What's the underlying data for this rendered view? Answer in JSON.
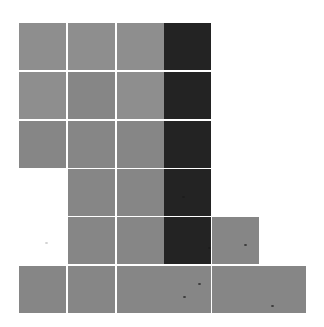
{
  "figure": {
    "colors": {
      "light": "#8e8e8e",
      "mid": "#868686",
      "dark": "#232323",
      "background": "#ffffff",
      "gap": "#ffffff"
    },
    "column_x": [
      19,
      68,
      117,
      164,
      212,
      259
    ],
    "row_y": [
      23,
      72,
      121,
      169,
      217,
      266
    ],
    "tiles": [
      {
        "row": 0,
        "col": 0,
        "shade": "light"
      },
      {
        "row": 0,
        "col": 1,
        "shade": "light"
      },
      {
        "row": 0,
        "col": 2,
        "shade": "light"
      },
      {
        "row": 0,
        "col": 3,
        "shade": "dark"
      },
      {
        "row": 1,
        "col": 0,
        "shade": "light"
      },
      {
        "row": 1,
        "col": 1,
        "shade": "mid"
      },
      {
        "row": 1,
        "col": 2,
        "shade": "light"
      },
      {
        "row": 1,
        "col": 3,
        "shade": "dark"
      },
      {
        "row": 2,
        "col": 0,
        "shade": "mid"
      },
      {
        "row": 2,
        "col": 1,
        "shade": "mid"
      },
      {
        "row": 2,
        "col": 2,
        "shade": "mid"
      },
      {
        "row": 2,
        "col": 3,
        "shade": "dark"
      },
      {
        "row": 3,
        "col": 1,
        "shade": "mid"
      },
      {
        "row": 3,
        "col": 2,
        "shade": "mid"
      },
      {
        "row": 3,
        "col": 3,
        "shade": "dark"
      },
      {
        "row": 4,
        "col": 1,
        "shade": "mid"
      },
      {
        "row": 4,
        "col": 2,
        "shade": "mid"
      },
      {
        "row": 4,
        "col": 3,
        "shade": "dark"
      },
      {
        "row": 4,
        "col": 4,
        "shade": "mid"
      },
      {
        "row": 5,
        "col": 0,
        "shade": "mid"
      },
      {
        "row": 5,
        "col": 1,
        "shade": "mid"
      },
      {
        "row": 5,
        "col": 2,
        "shade": "mid"
      },
      {
        "row": 5,
        "col": 3,
        "shade": "mid"
      },
      {
        "row": 5,
        "col": 4,
        "shade": "mid"
      },
      {
        "row": 5,
        "col": 5,
        "shade": "mid"
      }
    ],
    "specks": [
      {
        "x": 182,
        "y": 196,
        "tone": "dark"
      },
      {
        "x": 208,
        "y": 247,
        "tone": "dark"
      },
      {
        "x": 244,
        "y": 244,
        "tone": "dark"
      },
      {
        "x": 198,
        "y": 283,
        "tone": "dark"
      },
      {
        "x": 183,
        "y": 296,
        "tone": "dark"
      },
      {
        "x": 271,
        "y": 305,
        "tone": "dark"
      },
      {
        "x": 45,
        "y": 242,
        "tone": "light"
      }
    ]
  }
}
